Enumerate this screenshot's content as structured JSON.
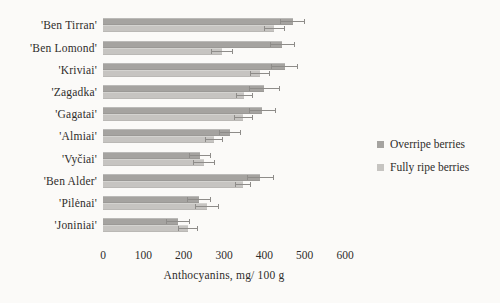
{
  "figure": {
    "background": "#fbfaf8",
    "text_color": "#2f2d2b"
  },
  "chart_data": {
    "type": "bar",
    "orientation": "horizontal",
    "title": "",
    "xlabel": "Anthocyanins, mg/ 100 g",
    "ylabel": "",
    "xlim": [
      0,
      600
    ],
    "xticks": [
      0,
      100,
      200,
      300,
      400,
      500,
      600
    ],
    "grid": false,
    "axis_lines": false,
    "legend_position": "right",
    "error_bars": true,
    "error_color": "#8e8c89",
    "categories": [
      "'Ben Tirran'",
      "'Ben Lomond'",
      "'Kriviai'",
      "'Zagadka'",
      "'Gagatai'",
      "'Almiai'",
      "'Vyčiai'",
      "'Ben Alder'",
      "'Pilėnai'",
      "'Joniniai'"
    ],
    "series": [
      {
        "name": "Overripe berries",
        "color": "#a5a3a0",
        "values": [
          470,
          445,
          450,
          400,
          395,
          315,
          240,
          390,
          238,
          185
        ],
        "errors": [
          30,
          31,
          34,
          38,
          33,
          28,
          28,
          33,
          30,
          30
        ]
      },
      {
        "name": "Fully ripe berries",
        "color": "#c6c4c1",
        "values": [
          425,
          295,
          390,
          350,
          348,
          275,
          250,
          348,
          258,
          210
        ],
        "errors": [
          27,
          28,
          25,
          21,
          23,
          22,
          27,
          20,
          30,
          25
        ]
      }
    ]
  }
}
